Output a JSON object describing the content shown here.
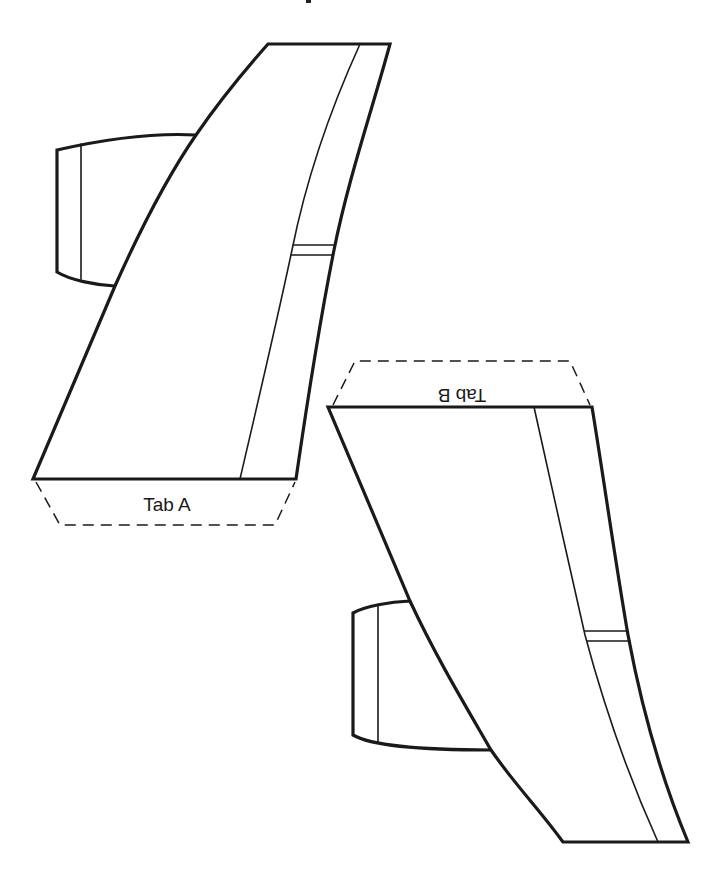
{
  "diagram": {
    "colors": {
      "line": "#1a1a1a",
      "background": "#ffffff"
    },
    "pieces": [
      {
        "id": "A",
        "name": "Fin piece A",
        "tab_label": "Tab A",
        "tab_orientation": "upright"
      },
      {
        "id": "B",
        "name": "Fin piece B",
        "tab_label": "Tab B",
        "tab_orientation": "rotated-180"
      }
    ]
  }
}
